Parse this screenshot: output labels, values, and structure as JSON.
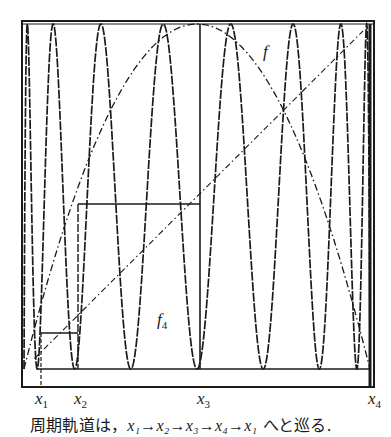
{
  "figure": {
    "curve_labels": {
      "f": "f",
      "f4_main": "f",
      "f4_sub": "4"
    },
    "x_labels": [
      {
        "main": "x",
        "sub": "1"
      },
      {
        "main": "x",
        "sub": "2"
      },
      {
        "main": "x",
        "sub": "3"
      },
      {
        "main": "x",
        "sub": "4"
      }
    ],
    "caption": {
      "prefix": "周期軌道は，",
      "orbit": "x₁→x₂→x₃→x₄→x₁",
      "suffix": " へと巡る."
    },
    "colors": {
      "ink": "#1a1a1a",
      "background": "#ffffff"
    }
  },
  "chart_data": {
    "type": "line",
    "title": "",
    "caption": "周期軌道は， x₁→x₂→x₃→x₄→x₁ へと巡る.",
    "xlabel": "",
    "ylabel": "",
    "xlim": [
      0,
      1
    ],
    "ylim": [
      0,
      1
    ],
    "grid": false,
    "series": [
      {
        "name": "f",
        "style": "dash-dot",
        "description": "single-hump map (parabola) f(x)"
      },
      {
        "name": "f4",
        "style": "solid-dashed",
        "description": "fourth iterate f⁴(x), 8 oscillations across [0,1]"
      },
      {
        "name": "diagonal",
        "style": "dash-dot",
        "description": "y = x"
      },
      {
        "name": "cobweb",
        "style": "solid",
        "description": "period-4 orbit path"
      }
    ],
    "annotations": [
      "x₁",
      "x₂",
      "x₃",
      "x₄",
      "f",
      "f₄"
    ],
    "orbit_points_approx": {
      "x1": 0.05,
      "x2": 0.16,
      "x3": 0.51,
      "x4": 0.99
    }
  }
}
